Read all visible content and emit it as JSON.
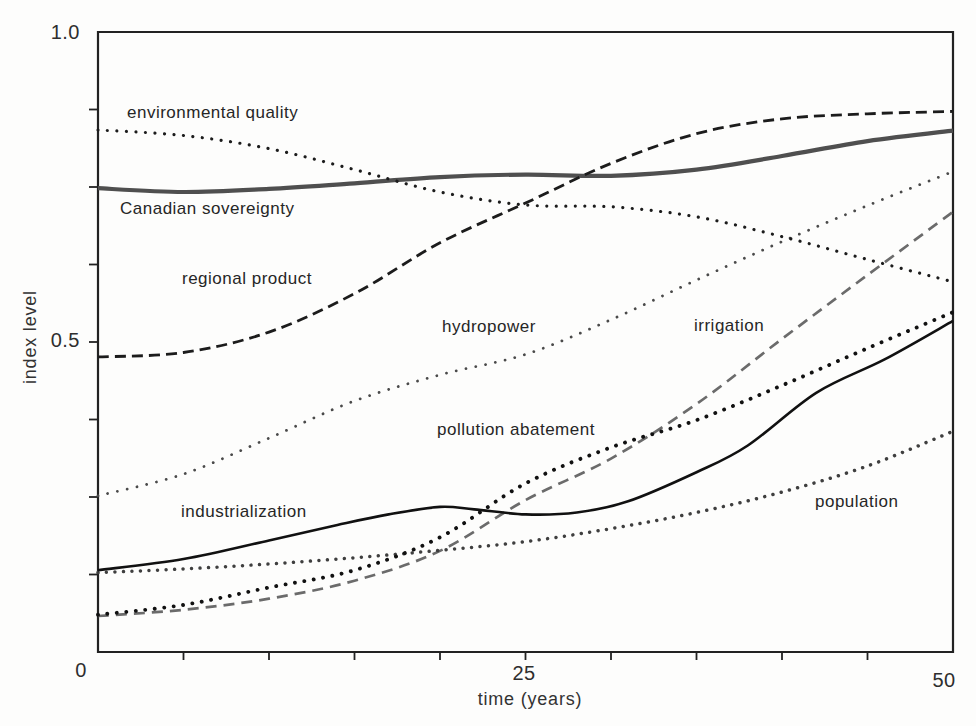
{
  "page": {
    "background": "#fdfdfc"
  },
  "axis": {
    "color": "#222222",
    "text_color": "#2b2b2b"
  },
  "chart_data": {
    "type": "line",
    "title": "",
    "xlabel": "time (years)",
    "ylabel": "index level",
    "xlim": [
      0,
      50
    ],
    "ylim": [
      0,
      1.0
    ],
    "x_ticks_labeled": {
      "values": [
        0,
        25,
        50
      ],
      "labels": [
        "0",
        "25",
        "50"
      ]
    },
    "x_minor_tick_step": 5,
    "y_ticks_labeled": {
      "values": [
        0.5,
        1.0
      ],
      "labels": [
        "0.5",
        "1.0"
      ]
    },
    "y_minor_tick_step": 0.125,
    "grid": false,
    "legend": "inline labels beside curves",
    "series": [
      {
        "name": "environmental quality",
        "color": "#1c1c1c",
        "line_style": "dotted",
        "stroke_width": 3.2,
        "dot_gap": 9.5,
        "x": [
          0,
          5,
          10,
          15,
          20,
          25,
          30,
          35,
          40,
          45,
          50
        ],
        "values": [
          0.842,
          0.833,
          0.812,
          0.778,
          0.742,
          0.721,
          0.718,
          0.702,
          0.67,
          0.633,
          0.597
        ]
      },
      {
        "name": "Canadian sovereignty",
        "color": "#4f4f4f",
        "line_style": "solid",
        "stroke_width": 4.2,
        "x": [
          0,
          5,
          10,
          15,
          20,
          25,
          30,
          35,
          40,
          45,
          50
        ],
        "values": [
          0.748,
          0.742,
          0.747,
          0.756,
          0.766,
          0.77,
          0.768,
          0.778,
          0.8,
          0.824,
          0.841
        ]
      },
      {
        "name": "regional product",
        "color": "#1c1c1c",
        "line_style": "dashed",
        "stroke_width": 2.8,
        "dash": [
          11,
          6
        ],
        "x": [
          0,
          5,
          10,
          15,
          20,
          25,
          30,
          35,
          40,
          45,
          50
        ],
        "values": [
          0.476,
          0.483,
          0.516,
          0.578,
          0.66,
          0.724,
          0.788,
          0.836,
          0.86,
          0.868,
          0.872
        ]
      },
      {
        "name": "hydropower",
        "color": "#4a4a4a",
        "line_style": "dotted",
        "stroke_width": 2.8,
        "dot_gap": 10,
        "x": [
          0,
          5,
          10,
          15,
          20,
          25,
          30,
          35,
          40,
          45,
          50
        ],
        "values": [
          0.252,
          0.287,
          0.345,
          0.405,
          0.447,
          0.48,
          0.536,
          0.6,
          0.662,
          0.72,
          0.775
        ]
      },
      {
        "name": "irrigation",
        "color": "#6b6b6b",
        "line_style": "dashed",
        "stroke_width": 2.7,
        "dash": [
          11,
          7
        ],
        "x": [
          0,
          5,
          10,
          15,
          20,
          25,
          30,
          35,
          40,
          45,
          50
        ],
        "values": [
          0.058,
          0.068,
          0.086,
          0.115,
          0.163,
          0.245,
          0.312,
          0.4,
          0.505,
          0.608,
          0.71
        ]
      },
      {
        "name": "pollution abatement",
        "color": "#111111",
        "line_style": "dotted",
        "stroke_width": 3.9,
        "dot_gap": 9.5,
        "x": [
          0,
          5,
          10,
          15,
          20,
          25,
          30,
          35,
          40,
          45,
          50
        ],
        "values": [
          0.06,
          0.076,
          0.104,
          0.132,
          0.185,
          0.272,
          0.33,
          0.374,
          0.43,
          0.49,
          0.548
        ]
      },
      {
        "name": "industrialization",
        "color": "#111111",
        "line_style": "solid",
        "stroke_width": 2.6,
        "x": [
          0,
          5,
          10,
          14,
          17,
          20,
          22,
          25,
          28,
          31,
          35,
          38,
          42,
          46,
          50
        ],
        "values": [
          0.132,
          0.15,
          0.18,
          0.205,
          0.222,
          0.234,
          0.23,
          0.222,
          0.225,
          0.243,
          0.29,
          0.333,
          0.418,
          0.472,
          0.534
        ]
      },
      {
        "name": "population",
        "color": "#3f3f3f",
        "line_style": "dotted",
        "stroke_width": 3.5,
        "dot_gap": 8.5,
        "x": [
          0,
          5,
          10,
          15,
          20,
          25,
          30,
          35,
          40,
          45,
          50
        ],
        "values": [
          0.128,
          0.134,
          0.142,
          0.152,
          0.164,
          0.178,
          0.199,
          0.225,
          0.258,
          0.3,
          0.356
        ]
      }
    ]
  }
}
